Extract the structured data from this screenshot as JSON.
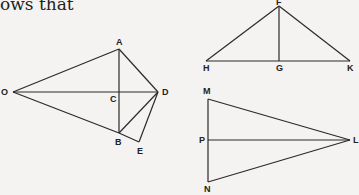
{
  "caption": "ows that",
  "figures": [
    {
      "name": "kite-figure",
      "points": {
        "O": [
          13,
          92
        ],
        "A": [
          119,
          49
        ],
        "D": [
          158,
          92
        ],
        "C": [
          119,
          92
        ],
        "B": [
          119,
          133
        ],
        "E": [
          139,
          142
        ]
      },
      "segments": [
        [
          "O",
          "A"
        ],
        [
          "A",
          "D"
        ],
        [
          "O",
          "B"
        ],
        [
          "O",
          "D"
        ],
        [
          "A",
          "B"
        ],
        [
          "B",
          "D"
        ],
        [
          "B",
          "E"
        ],
        [
          "E",
          "D"
        ]
      ],
      "labels": [
        {
          "text": "A",
          "x": 116,
          "y": 45
        },
        {
          "text": "O",
          "x": 1,
          "y": 95
        },
        {
          "text": "C",
          "x": 110,
          "y": 102
        },
        {
          "text": "D",
          "x": 162,
          "y": 95
        },
        {
          "text": "B",
          "x": 115,
          "y": 145
        },
        {
          "text": "E",
          "x": 137,
          "y": 154
        }
      ]
    },
    {
      "name": "triangle-fhk",
      "points": {
        "F": [
          279,
          6
        ],
        "H": [
          206,
          61
        ],
        "G": [
          279,
          61
        ],
        "K": [
          350,
          61
        ]
      },
      "segments": [
        [
          "F",
          "H"
        ],
        [
          "F",
          "K"
        ],
        [
          "H",
          "K"
        ],
        [
          "F",
          "G"
        ]
      ],
      "labels": [
        {
          "text": "F",
          "x": 276,
          "y": 5
        },
        {
          "text": "H",
          "x": 203,
          "y": 71
        },
        {
          "text": "G",
          "x": 276,
          "y": 71
        },
        {
          "text": "K",
          "x": 347,
          "y": 71
        }
      ]
    },
    {
      "name": "triangle-mnl",
      "points": {
        "M": [
          208,
          99
        ],
        "P": [
          208,
          140
        ],
        "N": [
          208,
          182
        ],
        "L": [
          350,
          140
        ]
      },
      "segments": [
        [
          "M",
          "N"
        ],
        [
          "M",
          "L"
        ],
        [
          "N",
          "L"
        ],
        [
          "P",
          "L"
        ]
      ],
      "labels": [
        {
          "text": "M",
          "x": 203,
          "y": 94
        },
        {
          "text": "P",
          "x": 199,
          "y": 143
        },
        {
          "text": "N",
          "x": 204,
          "y": 192
        },
        {
          "text": "L",
          "x": 353,
          "y": 143
        }
      ]
    }
  ]
}
